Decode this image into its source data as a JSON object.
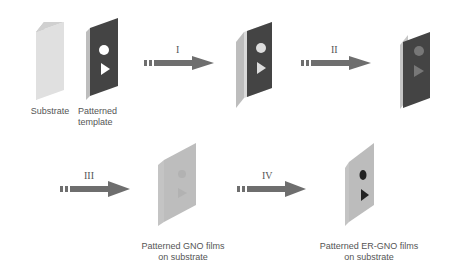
{
  "diagram": {
    "stages": [
      {
        "id": "substrate",
        "label": "Substrate"
      },
      {
        "id": "template",
        "label_line1": "Patterned",
        "label_line2": "template"
      },
      {
        "id": "stacked",
        "label": ""
      },
      {
        "id": "coated",
        "label": ""
      },
      {
        "id": "gno",
        "label_line1": "Patterned GNO films",
        "label_line2": "on substrate"
      },
      {
        "id": "ergno",
        "label_line1": "Patterned ER-GNO films",
        "label_line2": "on substrate"
      }
    ],
    "steps": [
      {
        "numeral": "I",
        "from": "template",
        "to": "stacked"
      },
      {
        "numeral": "II",
        "from": "stacked",
        "to": "coated"
      },
      {
        "numeral": "III",
        "from": "coated",
        "to": "gno"
      },
      {
        "numeral": "IV",
        "from": "gno",
        "to": "ergno"
      }
    ],
    "colors": {
      "substrate": "#d6d6d6",
      "substrate_edge": "#bcbcbc",
      "template": "#444444",
      "arrow": "#6e6e6e",
      "gno_film": "#bdbdbd",
      "er_shapes": "#222222"
    }
  }
}
